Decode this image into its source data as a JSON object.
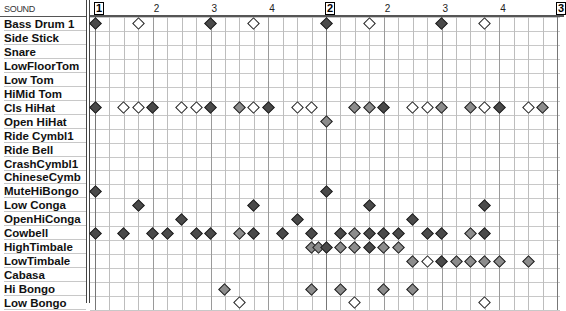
{
  "header": {
    "sound_label": "SOUND"
  },
  "ruler": {
    "measures": [
      {
        "label": "1",
        "col": 0
      },
      {
        "label": "2",
        "col": 16
      },
      {
        "label": "3",
        "col": 32
      }
    ],
    "beats": [
      {
        "label": "2",
        "col": 4
      },
      {
        "label": "3",
        "col": 8
      },
      {
        "label": "4",
        "col": 12
      },
      {
        "label": "2",
        "col": 20
      },
      {
        "label": "3",
        "col": 24
      },
      {
        "label": "4",
        "col": 28
      }
    ]
  },
  "instruments": [
    {
      "name": "Bass Drum 1",
      "notes": [
        [
          0,
          "d"
        ],
        [
          3,
          "o"
        ],
        [
          8,
          "d"
        ],
        [
          11,
          "o"
        ],
        [
          16,
          "d"
        ],
        [
          19,
          "o"
        ],
        [
          24,
          "d"
        ],
        [
          27,
          "o"
        ]
      ]
    },
    {
      "name": "Side Stick",
      "notes": []
    },
    {
      "name": "Snare",
      "notes": []
    },
    {
      "name": "LowFloorTom",
      "notes": []
    },
    {
      "name": "Low Tom",
      "notes": []
    },
    {
      "name": "HiMid Tom",
      "notes": []
    },
    {
      "name": "Cls HiHat",
      "notes": [
        [
          0,
          "d"
        ],
        [
          2,
          "o"
        ],
        [
          3,
          "o"
        ],
        [
          4,
          "d"
        ],
        [
          6,
          "o"
        ],
        [
          7,
          "o"
        ],
        [
          8,
          "d"
        ],
        [
          10,
          "g"
        ],
        [
          11,
          "o"
        ],
        [
          12,
          "d"
        ],
        [
          14,
          "o"
        ],
        [
          15,
          "o"
        ],
        [
          18,
          "g"
        ],
        [
          19,
          "g"
        ],
        [
          20,
          "d"
        ],
        [
          22,
          "o"
        ],
        [
          23,
          "o"
        ],
        [
          24,
          "g"
        ],
        [
          26,
          "g"
        ],
        [
          27,
          "o"
        ],
        [
          28,
          "d"
        ],
        [
          30,
          "o"
        ],
        [
          31,
          "g"
        ]
      ]
    },
    {
      "name": "Open HiHat",
      "notes": [
        [
          16,
          "g"
        ]
      ]
    },
    {
      "name": "Ride Cymbl1",
      "notes": []
    },
    {
      "name": "Ride Bell",
      "notes": []
    },
    {
      "name": "CrashCymbl1",
      "notes": []
    },
    {
      "name": "ChineseCymb",
      "notes": []
    },
    {
      "name": "MuteHiBongo",
      "notes": [
        [
          0,
          "d"
        ],
        [
          16,
          "d"
        ]
      ]
    },
    {
      "name": "Low Conga",
      "notes": [
        [
          3,
          "d"
        ],
        [
          11,
          "d"
        ],
        [
          19,
          "d"
        ],
        [
          27,
          "d"
        ]
      ]
    },
    {
      "name": "OpenHiConga",
      "notes": [
        [
          6,
          "d"
        ],
        [
          14,
          "d"
        ],
        [
          22,
          "d"
        ]
      ]
    },
    {
      "name": "Cowbell",
      "notes": [
        [
          0,
          "d"
        ],
        [
          2,
          "d"
        ],
        [
          4,
          "d"
        ],
        [
          5,
          "d"
        ],
        [
          7,
          "d"
        ],
        [
          8,
          "d"
        ],
        [
          10,
          "g"
        ],
        [
          11,
          "d"
        ],
        [
          13,
          "d"
        ],
        [
          15,
          "d"
        ],
        [
          17,
          "d"
        ],
        [
          18,
          "g"
        ],
        [
          19,
          "d"
        ],
        [
          20,
          "d"
        ],
        [
          21,
          "d"
        ],
        [
          23,
          "d"
        ],
        [
          24,
          "d"
        ],
        [
          26,
          "g"
        ],
        [
          27,
          "d"
        ]
      ]
    },
    {
      "name": "HighTimbale",
      "notes": [
        [
          15,
          "g"
        ],
        [
          15.5,
          "g"
        ],
        [
          16,
          "d"
        ],
        [
          17,
          "g"
        ],
        [
          18,
          "g"
        ],
        [
          19,
          "d"
        ],
        [
          20,
          "g"
        ],
        [
          21,
          "g"
        ]
      ]
    },
    {
      "name": "LowTimbale",
      "notes": [
        [
          22,
          "g"
        ],
        [
          23,
          "o"
        ],
        [
          24,
          "d"
        ],
        [
          25,
          "g"
        ],
        [
          26,
          "g"
        ],
        [
          27,
          "g"
        ],
        [
          28,
          "g"
        ],
        [
          30,
          "g"
        ]
      ]
    },
    {
      "name": "Cabasa",
      "notes": []
    },
    {
      "name": "Hi Bongo",
      "notes": [
        [
          9,
          "g"
        ],
        [
          15,
          "g"
        ],
        [
          17,
          "g"
        ],
        [
          20,
          "g"
        ],
        [
          22,
          "g"
        ]
      ]
    },
    {
      "name": "Low Bongo",
      "notes": [
        [
          10,
          "o"
        ],
        [
          18,
          "o"
        ],
        [
          27,
          "o"
        ]
      ]
    }
  ],
  "colors": {
    "dark_note": "#4a4a4a",
    "gray_note": "#8c8c8c",
    "open_note": "#ffffff"
  }
}
